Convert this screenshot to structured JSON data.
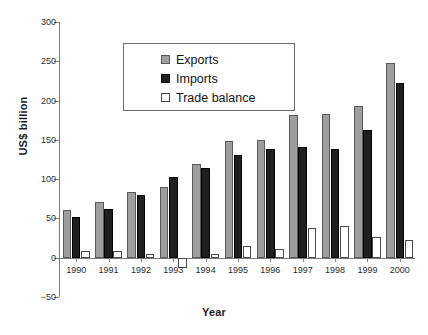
{
  "chart_data": {
    "type": "bar",
    "title": "",
    "xlabel": "Year",
    "ylabel": "US$ billion",
    "ylim": [
      -50,
      300
    ],
    "yticks": [
      -50,
      0,
      50,
      100,
      150,
      200,
      250,
      300
    ],
    "ytick_labels": [
      "−50",
      "0",
      "50",
      "100",
      "150",
      "200",
      "250",
      "300"
    ],
    "grid": false,
    "legend_position": "upper center",
    "categories": [
      "1990",
      "1991",
      "1992",
      "1993",
      "1994",
      "1995",
      "1996",
      "1997",
      "1998",
      "1999",
      "2000"
    ],
    "series": [
      {
        "name": "Exports",
        "color": "#9e9e9e",
        "values": [
          61,
          71,
          84,
          90,
          119,
          148,
          150,
          182,
          183,
          193,
          248
        ]
      },
      {
        "name": "Imports",
        "color": "#1f1f1f",
        "values": [
          52,
          62,
          80,
          103,
          114,
          131,
          138,
          141,
          138,
          163,
          222
        ]
      },
      {
        "name": "Trade balance",
        "color": "#ffffff",
        "values": [
          9,
          9,
          5,
          -13,
          5,
          15,
          11,
          38,
          40,
          26,
          22
        ]
      }
    ]
  },
  "axes": {
    "ylabel": "US$ billion",
    "xlabel": "Year"
  },
  "legend": {
    "items": [
      {
        "label": "Exports",
        "swatch": "exports-swatch"
      },
      {
        "label": "Imports",
        "swatch": "imports-swatch"
      },
      {
        "label": "Trade balance",
        "swatch": "trade-balance-swatch"
      }
    ]
  }
}
